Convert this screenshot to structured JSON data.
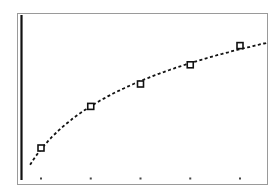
{
  "chart_data": {
    "type": "scatter",
    "title": "",
    "xlabel": "",
    "ylabel": "",
    "grid": false,
    "legend": null,
    "x": [
      1,
      2,
      3,
      4,
      5
    ],
    "series": [
      {
        "name": "data",
        "marker": "square",
        "values": [
          1.0,
          2.3,
          3.0,
          3.6,
          4.2
        ]
      },
      {
        "name": "fit",
        "style": "dotted-curve",
        "model": "logarithmic"
      }
    ],
    "xlim": [
      0.6,
      5.6
    ],
    "ylim": [
      0,
      5.0
    ],
    "x_ticks": [
      1,
      2,
      3,
      4,
      5
    ],
    "colors": {
      "frame": "#9a9a9a",
      "axis": "#111111",
      "curve": "#111111",
      "marker": "#111111",
      "tick": "#444444"
    }
  }
}
